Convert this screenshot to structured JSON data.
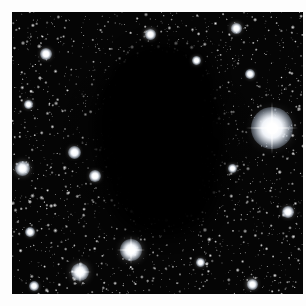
{
  "image": {
    "subject": "dark-nebula-bok-globule-in-dense-star-field",
    "domain_label": "astronomical-photograph",
    "caption": "",
    "canvas": {
      "width": 306,
      "height": 306,
      "background_color": "#ffffff"
    },
    "frame": {
      "x": 12,
      "y": 12,
      "width": 291,
      "height": 282,
      "background_color": "#050505",
      "border_color": "#ffffff",
      "margin_px": 12
    },
    "palette": {
      "sky_background": "#050505",
      "star_white": "#ffffff",
      "star_halo": "#e9eef6",
      "nebula_black": "#000000",
      "page_white": "#ffffff"
    },
    "features": {
      "dark_nebula": {
        "name": "dark-nebula",
        "description": "opaque irregular dust cloud occulting background stars",
        "center_x": 148,
        "center_y": 124,
        "width": 132,
        "height": 172,
        "opacity": 1.0
      },
      "star_field": {
        "name": "star-field",
        "description": "dense field of thousands of faint stars surrounding the dark cloud",
        "density": "very-high",
        "coverage": "full-frame-except-nebula"
      }
    },
    "bright_stars": [
      {
        "name": "bright-star-right",
        "x": 272,
        "y": 128,
        "size": 11,
        "glow": 42,
        "spikes": true
      },
      {
        "name": "bright-star-lower-center",
        "x": 131,
        "y": 250,
        "size": 7,
        "glow": 22,
        "spikes": true
      },
      {
        "name": "bright-star-lower-left",
        "x": 80,
        "y": 272,
        "size": 6,
        "glow": 18,
        "spikes": true
      },
      {
        "name": "bright-star-left-mid",
        "x": 22,
        "y": 168,
        "size": 5,
        "glow": 15,
        "spikes": false
      },
      {
        "name": "bright-star-left-upper",
        "x": 74,
        "y": 152,
        "size": 4,
        "glow": 13,
        "spikes": false
      },
      {
        "name": "bright-star-mid-left",
        "x": 95,
        "y": 176,
        "size": 4,
        "glow": 12,
        "spikes": false
      },
      {
        "name": "bright-star-upper-left",
        "x": 46,
        "y": 54,
        "size": 4,
        "glow": 12,
        "spikes": false
      },
      {
        "name": "bright-star-top-center",
        "x": 150,
        "y": 34,
        "size": 4,
        "glow": 11,
        "spikes": false
      },
      {
        "name": "bright-star-top-right",
        "x": 236,
        "y": 28,
        "size": 4,
        "glow": 11,
        "spikes": false
      },
      {
        "name": "bright-star-right-lower",
        "x": 288,
        "y": 212,
        "size": 4,
        "glow": 12,
        "spikes": false
      },
      {
        "name": "bright-star-bottom-right",
        "x": 252,
        "y": 284,
        "size": 4,
        "glow": 11,
        "spikes": false
      },
      {
        "name": "bright-star-bottom-left",
        "x": 34,
        "y": 286,
        "size": 3,
        "glow": 10,
        "spikes": false
      },
      {
        "name": "bright-star-right-upper",
        "x": 250,
        "y": 74,
        "size": 3,
        "glow": 10,
        "spikes": false
      },
      {
        "name": "bright-star-left-lower",
        "x": 30,
        "y": 232,
        "size": 3,
        "glow": 10,
        "spikes": false
      },
      {
        "name": "bright-star-mid-right",
        "x": 232,
        "y": 168,
        "size": 3,
        "glow": 9,
        "spikes": false
      },
      {
        "name": "bright-star-upper-mid",
        "x": 196,
        "y": 60,
        "size": 3,
        "glow": 9,
        "spikes": false
      },
      {
        "name": "bright-star-lower-right2",
        "x": 200,
        "y": 262,
        "size": 3,
        "glow": 9,
        "spikes": false
      },
      {
        "name": "bright-star-left-top",
        "x": 28,
        "y": 104,
        "size": 3,
        "glow": 9,
        "spikes": false
      }
    ],
    "chart_data": {
      "type": "scatter",
      "title": "",
      "xlabel": "",
      "ylabel": "",
      "description": "Stellar positions and relative brightnesses across the frame",
      "xlim": [
        12,
        303
      ],
      "ylim": [
        12,
        294
      ],
      "grid": false,
      "legend": null,
      "series": [
        {
          "name": "bright stars",
          "x": [
            272,
            131,
            80,
            22,
            74,
            95,
            46,
            150,
            236,
            288,
            252,
            34,
            250,
            30,
            232,
            196,
            200,
            28
          ],
          "y": [
            128,
            250,
            272,
            168,
            152,
            176,
            54,
            34,
            28,
            212,
            284,
            286,
            74,
            232,
            168,
            60,
            262,
            104
          ],
          "magnitude": [
            11,
            7,
            6,
            5,
            4,
            4,
            4,
            4,
            4,
            4,
            4,
            3,
            3,
            3,
            3,
            3,
            3,
            3
          ]
        },
        {
          "name": "background star field",
          "count_estimate": 4000,
          "distribution": "uniform-except-nebula"
        }
      ]
    }
  }
}
